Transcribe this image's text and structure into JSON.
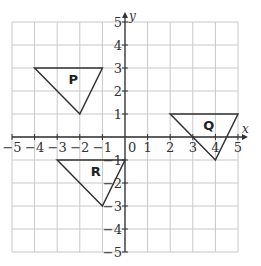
{
  "diagram": {
    "type": "coordinate-grid",
    "x_axis": {
      "label": "x",
      "min": -5,
      "max": 5,
      "ticks": [
        "-5",
        "-4",
        "-3",
        "-2",
        "-1",
        "1",
        "2",
        "3",
        "4",
        "5"
      ]
    },
    "y_axis": {
      "label": "y",
      "min": -5,
      "max": 5,
      "ticks": [
        "5",
        "4",
        "3",
        "2",
        "1",
        "-1",
        "-2",
        "-3",
        "-4",
        "-5"
      ]
    },
    "origin_label": "0",
    "shapes": [
      {
        "name": "P",
        "label": "P",
        "vertices": [
          [
            -4,
            3
          ],
          [
            -1,
            3
          ],
          [
            -2,
            1
          ]
        ]
      },
      {
        "name": "Q",
        "label": "Q",
        "vertices": [
          [
            2,
            1
          ],
          [
            5,
            1
          ],
          [
            4,
            -1
          ]
        ]
      },
      {
        "name": "R",
        "label": "R",
        "vertices": [
          [
            -3,
            -1
          ],
          [
            0,
            -1
          ],
          [
            -1,
            -3
          ]
        ]
      }
    ],
    "colors": {
      "grid": "#c8c8c8",
      "axis": "#333333",
      "shape": "#333333"
    }
  }
}
